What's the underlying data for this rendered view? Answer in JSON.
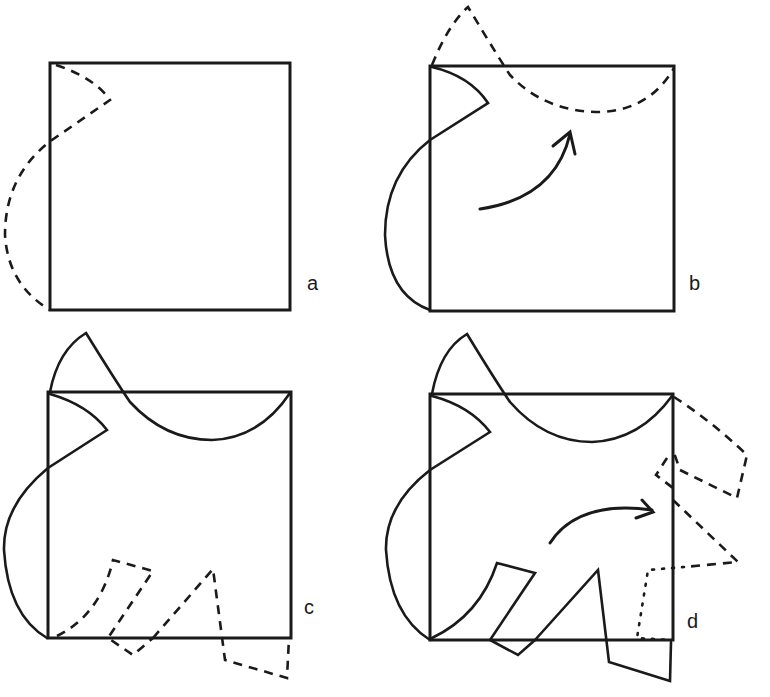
{
  "figure": {
    "panels": [
      {
        "id": "a",
        "label": "a",
        "description": "Square with a dashed curved cut-out along the left edge near top-left corner"
      },
      {
        "id": "b",
        "label": "b",
        "description": "Left-edge piece drawn solid; dashed piece rotated to top edge; curved arrow indicates rotation"
      },
      {
        "id": "c",
        "label": "c",
        "description": "Top and left curves solid; dashed shapes along the bottom edge"
      },
      {
        "id": "d",
        "label": "d",
        "description": "Bottom shapes solid; dashed shapes rotated to right edge; dotted outline at bottom-right corner; curved arrow indicates rotation"
      }
    ],
    "colors": {
      "ink": "#1a1a1a",
      "background": "#ffffff"
    },
    "line_styles": [
      "solid",
      "dashed",
      "dotted"
    ]
  }
}
